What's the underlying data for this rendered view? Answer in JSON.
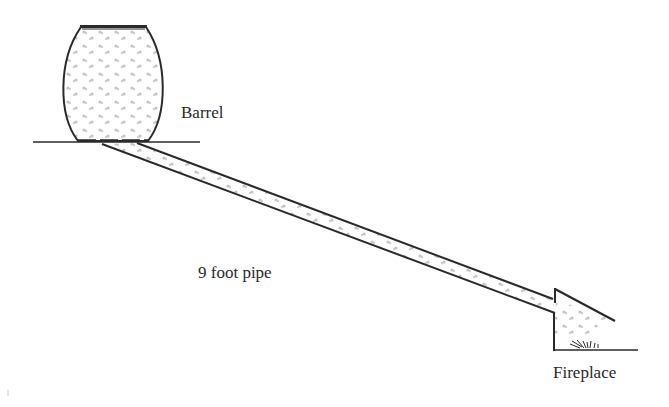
{
  "diagram": {
    "type": "gravity-feed sketch",
    "labels": {
      "barrel": "Barrel",
      "pipe": "9 foot pipe",
      "fireplace": "Fireplace"
    },
    "colors": {
      "ink": "#2a2a2a",
      "fill_dots": "#b8b8b8",
      "background": "#ffffff"
    }
  }
}
